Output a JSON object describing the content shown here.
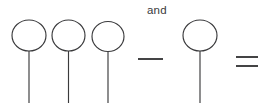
{
  "canvas": {
    "width": 264,
    "height": 107,
    "background_color": "#ffffff",
    "stroke_color": "#3a3a3c"
  },
  "expression": {
    "label_and": "and",
    "operator_minus": "—",
    "operator_equals": "=",
    "left_group_count": 3,
    "right_group_count": 1
  },
  "figure": {
    "type": "hand-drawn-math-expression",
    "elements": [
      {
        "kind": "lollipop",
        "name": "lollipop-1",
        "cx": 29,
        "cy": 35.5,
        "rx": 17,
        "ry": 15.5,
        "stem_x": 29,
        "stem_y1": 51,
        "stem_y2": 103
      },
      {
        "kind": "lollipop",
        "name": "lollipop-2",
        "cx": 68.5,
        "cy": 35.5,
        "rx": 16.5,
        "ry": 15.5,
        "stem_x": 68.5,
        "stem_y1": 51,
        "stem_y2": 103
      },
      {
        "kind": "lollipop",
        "name": "lollipop-3",
        "cx": 108,
        "cy": 36.5,
        "rx": 16,
        "ry": 15,
        "stem_x": 108,
        "stem_y1": 51.5,
        "stem_y2": 103
      },
      {
        "kind": "operator",
        "name": "minus",
        "x1": 138,
        "y1": 59,
        "x2": 163,
        "y2": 59
      },
      {
        "kind": "lollipop",
        "name": "lollipop-4",
        "cx": 200,
        "cy": 35.5,
        "rx": 17,
        "ry": 15.5,
        "stem_x": 200,
        "stem_y1": 51,
        "stem_y2": 103
      },
      {
        "kind": "operator",
        "name": "equals",
        "bar1": {
          "x1": 236,
          "y1": 57,
          "x2": 258,
          "y2": 57
        },
        "bar2": {
          "x1": 236,
          "y1": 66,
          "x2": 258,
          "y2": 66
        }
      }
    ]
  }
}
